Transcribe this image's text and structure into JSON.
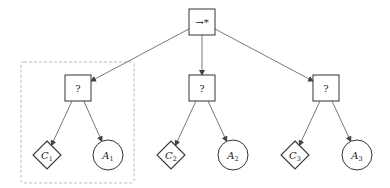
{
  "diagram": {
    "type": "behavior-tree",
    "root": {
      "id": "root",
      "label": "→*",
      "shape": "square",
      "cx": 202,
      "cy": 22
    },
    "selectors": [
      {
        "id": "sel1",
        "label": "?",
        "shape": "square",
        "cx": 78,
        "cy": 88
      },
      {
        "id": "sel2",
        "label": "?",
        "shape": "square",
        "cx": 202,
        "cy": 88
      },
      {
        "id": "sel3",
        "label": "?",
        "shape": "square",
        "cx": 326,
        "cy": 88
      }
    ],
    "leaves": [
      {
        "id": "c1",
        "base": "C",
        "sub": "1",
        "shape": "diamond",
        "cx": 47,
        "cy": 155,
        "parent": "sel1"
      },
      {
        "id": "a1",
        "base": "A",
        "sub": "1",
        "shape": "circle",
        "cx": 108,
        "cy": 155,
        "parent": "sel1"
      },
      {
        "id": "c2",
        "base": "C",
        "sub": "2",
        "shape": "diamond",
        "cx": 171,
        "cy": 155,
        "parent": "sel2"
      },
      {
        "id": "a2",
        "base": "A",
        "sub": "2",
        "shape": "circle",
        "cx": 233,
        "cy": 155,
        "parent": "sel2"
      },
      {
        "id": "c3",
        "base": "C",
        "sub": "3",
        "shape": "diamond",
        "cx": 295,
        "cy": 155,
        "parent": "sel3"
      },
      {
        "id": "a3",
        "base": "A",
        "sub": "3",
        "shape": "circle",
        "cx": 357,
        "cy": 155,
        "parent": "sel3"
      }
    ],
    "highlight_box": {
      "x": 21,
      "y": 62,
      "width": 113,
      "height": 121,
      "style": "dashed"
    },
    "colors": {
      "stroke": "#333333",
      "dashed": "#aaaaaa",
      "edge": "#555555"
    }
  }
}
